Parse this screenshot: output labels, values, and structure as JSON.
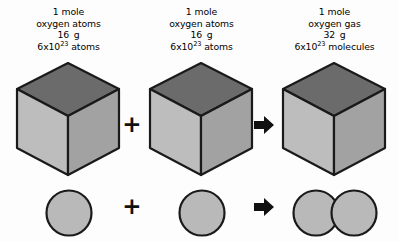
{
  "diagram": {
    "background_color": "#fdfdfd"
  },
  "colors": {
    "cube_top_face": "#6b6b6b",
    "cube_left_face": "#bdbdbd",
    "cube_right_face": "#a2a2a2",
    "sphere_fill": "#b9b9b9",
    "outline": "#1a1a1a",
    "operator": "#111111",
    "text": "#000000"
  },
  "columns": [
    {
      "id": "reactant-1",
      "label": {
        "line1": "1 mole",
        "line2": "oxygen atoms",
        "line3_mass": "16",
        "line3_unit": "g",
        "line4_coefficient": "6x10",
        "line4_exponent": "23",
        "line4_unit": "atoms"
      },
      "cube": {
        "name": "mole-cube-oxygen-atoms-1"
      },
      "particle": {
        "name": "oxygen-atom-sphere-1",
        "atom_count": 1
      }
    },
    {
      "id": "reactant-2",
      "label": {
        "line1": "1 mole",
        "line2": "oxygen atoms",
        "line3_mass": "16",
        "line3_unit": "g",
        "line4_coefficient": "6x10",
        "line4_exponent": "23",
        "line4_unit": "atoms"
      },
      "cube": {
        "name": "mole-cube-oxygen-atoms-2"
      },
      "particle": {
        "name": "oxygen-atom-sphere-2",
        "atom_count": 1
      }
    },
    {
      "id": "product",
      "label": {
        "line1": "1 mole",
        "line2": "oxygen gas",
        "line3_mass": "32",
        "line3_unit": "g",
        "line4_coefficient": "6x10",
        "line4_exponent": "23",
        "line4_unit": "molecules"
      },
      "cube": {
        "name": "mole-cube-oxygen-gas"
      },
      "particle": {
        "name": "oxygen-molecule-spheres",
        "atom_count": 2
      }
    }
  ],
  "operators": {
    "plus_top": "+",
    "plus_bottom": "+",
    "arrow_top": "arrow-right-icon",
    "arrow_bottom": "arrow-right-icon"
  }
}
